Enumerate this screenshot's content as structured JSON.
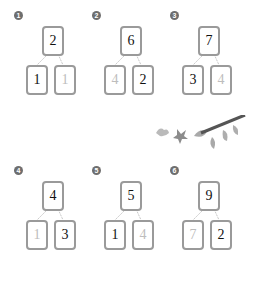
{
  "problems": [
    {
      "label": "1",
      "top": "2",
      "left": "1",
      "right": "1",
      "left_faded": false,
      "right_faded": true
    },
    {
      "label": "2",
      "top": "6",
      "left": "4",
      "right": "2",
      "left_faded": true,
      "right_faded": false
    },
    {
      "label": "3",
      "top": "7",
      "left": "3",
      "right": "4",
      "left_faded": false,
      "right_faded": true
    },
    {
      "label": "4",
      "top": "4",
      "left": "1",
      "right": "3",
      "left_faded": true,
      "right_faded": false
    },
    {
      "label": "5",
      "top": "5",
      "left": "1",
      "right": "4",
      "left_faded": false,
      "right_faded": true
    },
    {
      "label": "6",
      "top": "9",
      "left": "7",
      "right": "2",
      "left_faded": true,
      "right_faded": false
    }
  ],
  "decoration": {
    "icon": "leaves-branch-icon",
    "color": "#7a7a7a"
  }
}
